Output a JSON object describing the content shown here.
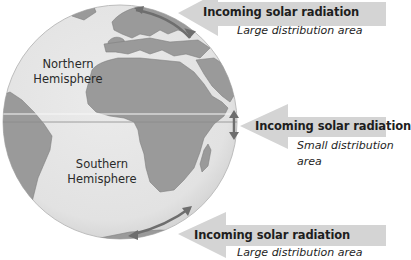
{
  "diagram": {
    "colors": {
      "ocean": "#e6e6e6",
      "land": "#9a9a9a",
      "arrow_fill": "#d4d4d4",
      "distribution_arrow": "#6e6e6e",
      "equator_line": "#8a8a8a"
    },
    "hemispheres": {
      "north": {
        "line1": "Northern",
        "line2": "Hemisphere"
      },
      "south": {
        "line1": "Southern",
        "line2": "Hemisphere"
      }
    },
    "arrows": [
      {
        "position": "top",
        "label": "Incoming solar radiation",
        "sub1": "Large distribution area",
        "sub2": ""
      },
      {
        "position": "middle",
        "label": "Incoming solar radiation",
        "sub1": "Small distribution",
        "sub2": "area"
      },
      {
        "position": "bottom",
        "label": "Incoming solar radiation",
        "sub1": "Large distribution area",
        "sub2": ""
      }
    ]
  }
}
